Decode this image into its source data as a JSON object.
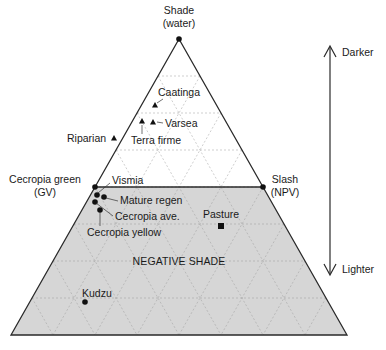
{
  "diagram": {
    "type": "ternary",
    "title": "",
    "geometry": {
      "apex": [
        179,
        39
      ],
      "left": [
        11,
        335
      ],
      "right": [
        347,
        335
      ],
      "divisions": 8,
      "shade_cut_level": 4
    },
    "colors": {
      "line": "#2a2a2a",
      "shaded_region": "#d6d6d6",
      "grid": "#9a9a9a",
      "text": "#1a1a1a"
    },
    "vertices": [
      {
        "id": "shade",
        "lines": [
          "Shade",
          "(water)"
        ],
        "pos": [
          179,
          39
        ],
        "label_x": 179,
        "label_y": [
          14,
          27
        ],
        "anchor": "middle"
      },
      {
        "id": "gv",
        "lines": [
          "Cecropia green",
          "(GV)"
        ],
        "pos": [
          95,
          187
        ],
        "label_x": 45,
        "label_y": [
          183,
          196
        ],
        "anchor": "middle"
      },
      {
        "id": "npv",
        "lines": [
          "Slash",
          "(NPV)"
        ],
        "pos": [
          263,
          187
        ],
        "label_x": 285,
        "label_y": [
          183,
          196
        ],
        "anchor": "middle"
      }
    ],
    "region_label": {
      "text": "NEGATIVE SHADE",
      "x": 179,
      "y": 265
    },
    "points": [
      {
        "name": "Caatinga",
        "marker": "triangle",
        "pos": [
          155,
          105
        ],
        "label": [
          158,
          96
        ],
        "anchor": "start",
        "leader": [
          [
            157,
            103
          ],
          [
            163,
            99
          ]
        ]
      },
      {
        "name": "Varsea",
        "marker": "triangle",
        "pos": [
          153,
          122
        ],
        "label": [
          165,
          127
        ],
        "anchor": "start",
        "leader": [
          [
            157,
            122
          ],
          [
            163,
            123
          ]
        ]
      },
      {
        "name": "Terra firme",
        "marker": "triangle",
        "pos": [
          142,
          121
        ],
        "label": [
          131,
          144
        ],
        "anchor": "start",
        "leader": [
          [
            142,
            125
          ],
          [
            142,
            134
          ]
        ]
      },
      {
        "name": "Riparian",
        "marker": "triangle",
        "pos": [
          114,
          138
        ],
        "label": [
          67,
          142
        ],
        "anchor": "start",
        "leader": null
      },
      {
        "name": "Vismia",
        "marker": "circle",
        "pos": [
          97,
          195
        ],
        "label": [
          112,
          184
        ],
        "anchor": "start",
        "leader": [
          [
            98,
            193
          ],
          [
            110,
            183
          ]
        ]
      },
      {
        "name": "Mature regen",
        "marker": "circle",
        "pos": [
          104,
          197
        ],
        "label": [
          120,
          204
        ],
        "anchor": "start",
        "leader": [
          [
            106,
            198
          ],
          [
            118,
            201
          ]
        ]
      },
      {
        "name": "Cecropia ave.",
        "marker": "circle",
        "pos": [
          95,
          202
        ],
        "label": [
          115,
          220
        ],
        "anchor": "start",
        "leader": [
          [
            96,
            203
          ],
          [
            113,
            216
          ]
        ]
      },
      {
        "name": "Cecropia yellow",
        "marker": "circle",
        "pos": [
          100,
          210
        ],
        "label": [
          87,
          236
        ],
        "anchor": "start",
        "leader": [
          [
            100,
            212
          ],
          [
            100,
            226
          ]
        ]
      },
      {
        "name": "Pasture",
        "marker": "square",
        "pos": [
          221,
          226
        ],
        "label": [
          203,
          218
        ],
        "anchor": "start",
        "leader": null
      },
      {
        "name": "Kudzu",
        "marker": "circle",
        "pos": [
          85,
          302
        ],
        "label": [
          82,
          297
        ],
        "anchor": "start",
        "leader": null
      }
    ],
    "brightness_axis": {
      "x": 330,
      "y_top": 46,
      "y_bottom": 275,
      "top_label": "Darker",
      "bottom_label": "Lighter",
      "label_x": 342,
      "top_label_y": 56,
      "bottom_label_y": 273
    }
  }
}
